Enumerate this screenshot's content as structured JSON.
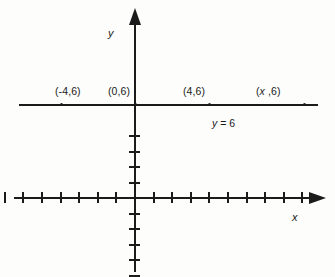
{
  "figure": {
    "type": "coordinate-plane",
    "axis_labels": {
      "x": "x",
      "y": "y"
    },
    "equation_label": "y = 6"
  },
  "point_labels": [
    {
      "text_open": "(",
      "x_part": "-4",
      "rest": ",6)",
      "full": "(-4,6)",
      "italic_x": false,
      "left": 55,
      "top": 86
    },
    {
      "text_open": "(",
      "x_part": "0",
      "rest": ",6)",
      "full": "(0,6)",
      "italic_x": false,
      "left": 108,
      "top": 86
    },
    {
      "text_open": "(",
      "x_part": "4",
      "rest": ",6)",
      "full": "(4,6)",
      "italic_x": false,
      "left": 183,
      "top": 86
    },
    {
      "text_open": "(",
      "x_part": "x",
      "rest": ",6)",
      "full": "(x ,6)",
      "italic_x": true,
      "left": 256,
      "top": 86
    }
  ],
  "chart_data": {
    "type": "line",
    "title": "",
    "xlabel": "x",
    "ylabel": "y",
    "equation": "y = 6",
    "xlim": [
      -9,
      10
    ],
    "ylim": [
      -9,
      5
    ],
    "grid": false,
    "legend": "none",
    "tick_spacing": 1,
    "x_ticks_left_of_origin": 8,
    "x_ticks_right_of_origin": 9,
    "y_ticks_above_origin": 4,
    "y_ticks_below_origin": 8,
    "series": [
      {
        "name": "y = 6",
        "label": "y = 6",
        "points": [
          {
            "x": -4,
            "y": 6,
            "label": "(-4,6)"
          },
          {
            "x": 0,
            "y": 6,
            "label": "(0,6)"
          },
          {
            "x": 4,
            "y": 6,
            "label": "(4,6)"
          },
          {
            "x": "x",
            "y": 6,
            "label": "(x ,6)"
          }
        ]
      }
    ],
    "annotations": [
      {
        "text": "y = 6",
        "x": 5.2,
        "y": 4.6
      }
    ]
  },
  "colors": {
    "ink": "#1b1b1b",
    "background": "#fdfdfc"
  }
}
